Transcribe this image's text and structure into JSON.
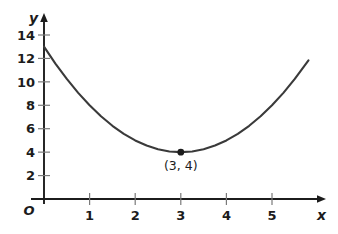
{
  "chart_data": {
    "type": "line",
    "title": "",
    "subtitle": "",
    "xlabel": "x",
    "ylabel": "y",
    "origin_label": "O",
    "grid": false,
    "legend": null,
    "xlim": [
      0,
      5.8
    ],
    "ylim": [
      0,
      14.8
    ],
    "x_ticks": [
      1,
      2,
      3,
      4,
      5
    ],
    "x_tick_labels": [
      "1",
      "2",
      "3",
      "4",
      "5"
    ],
    "y_ticks": [
      2,
      4,
      6,
      8,
      10,
      12,
      14
    ],
    "y_tick_labels": [
      "2",
      "4",
      "6",
      "8",
      "10",
      "12",
      "14"
    ],
    "equation": "y = (x - 3)^2 + 4",
    "series": [
      {
        "name": "parabola",
        "color": "#3a3a3a",
        "x": [
          0.0,
          0.25,
          0.5,
          0.75,
          1.0,
          1.25,
          1.5,
          1.75,
          2.0,
          2.25,
          2.5,
          2.75,
          3.0,
          3.25,
          3.5,
          3.75,
          4.0,
          4.25,
          4.5,
          4.75,
          5.0,
          5.25,
          5.5,
          5.8
        ],
        "y": [
          13.0,
          11.56,
          10.25,
          9.06,
          8.0,
          7.06,
          6.25,
          5.56,
          5.0,
          4.56,
          4.25,
          4.06,
          4.0,
          4.06,
          4.25,
          4.56,
          5.0,
          5.56,
          6.25,
          7.06,
          8.0,
          9.06,
          10.25,
          11.84
        ]
      }
    ],
    "annotations": [
      {
        "name": "vertex",
        "label": "(3, 4)",
        "x": 3,
        "y": 4,
        "marker": "dot",
        "marker_color": "#1c1c1c",
        "label_position": "below"
      }
    ]
  },
  "colors": {
    "background": "#ffffff",
    "axis": "#1c1c1c",
    "tick": "#7a7a7a",
    "curve": "#3a3a3a",
    "text": "#1c1c1c"
  }
}
